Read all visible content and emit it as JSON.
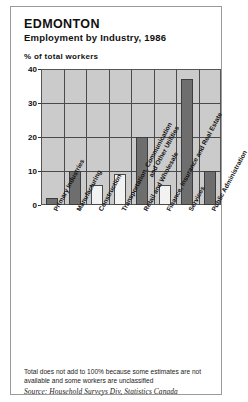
{
  "header": {
    "title": "EDMONTON",
    "subtitle": "Employment by Industry, 1986",
    "axis_caption": "% of total workers"
  },
  "footer": {
    "note": "Total does not add to 100% because some estimates are not available and some workers are unclassified",
    "source": "Source: Household Surveys Div, Statistics Canada"
  },
  "style": {
    "plot_background": "#cbcbcb",
    "dark_bar_color": "#6e6e6e",
    "light_bar_color": "#f2f2f2",
    "bar_outline_color": "#4a4a4a",
    "grid_color": "#4a4a4a",
    "frame_color": "#9a9a9a"
  },
  "chart_data": {
    "type": "bar",
    "title": "Employment by Industry, 1986",
    "subtitle": "EDMONTON",
    "xlabel": "",
    "ylabel": "% of total workers",
    "ylim": [
      0,
      40
    ],
    "yticks": [
      0,
      10,
      20,
      30,
      40
    ],
    "grid": true,
    "legend": "none",
    "categories": [
      "Primary Industries",
      "Manufacturing",
      "Construction",
      "Transportation, Communication\nand Other Utilities",
      "Retail and Wholesale",
      "Finance, Insurance and Real Estate",
      "Services",
      "Public Administration"
    ],
    "values": [
      2,
      10,
      6,
      9,
      20,
      6,
      37,
      10
    ],
    "bar_fills": [
      "dark",
      "dark",
      "light",
      "light",
      "dark",
      "light",
      "dark",
      "dark"
    ],
    "annotation": "Total does not add to 100% because some estimates are not available and some workers are unclassified",
    "source": "Source: Household Surveys Div, Statistics Canada"
  }
}
